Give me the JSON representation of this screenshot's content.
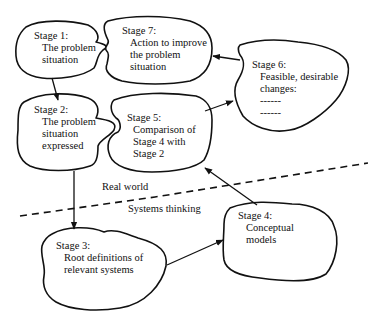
{
  "diagram": {
    "type": "soft-systems-methodology",
    "stages": [
      {
        "id": "stage1",
        "title": "Stage 1:",
        "lines": [
          "The problem",
          "situation"
        ]
      },
      {
        "id": "stage2",
        "title": "Stage 2:",
        "lines": [
          "The problem",
          "situation",
          "expressed"
        ]
      },
      {
        "id": "stage3",
        "title": "Stage 3:",
        "lines": [
          "Root definitions of",
          "relevant systems"
        ]
      },
      {
        "id": "stage4",
        "title": "Stage 4:",
        "lines": [
          "Conceptual",
          "models"
        ]
      },
      {
        "id": "stage5",
        "title": "Stage 5:",
        "lines": [
          "Comparison of",
          "Stage 4 with",
          "Stage 2"
        ]
      },
      {
        "id": "stage6",
        "title": "Stage 6:",
        "lines": [
          "Feasible, desirable",
          "changes:",
          "------",
          "------"
        ]
      },
      {
        "id": "stage7",
        "title": "Stage 7:",
        "lines": [
          "Action to improve",
          "the problem",
          "situation"
        ]
      }
    ],
    "edges": [
      {
        "from": "stage1",
        "to": "stage2"
      },
      {
        "from": "stage2",
        "to": "stage3"
      },
      {
        "from": "stage3",
        "to": "stage4"
      },
      {
        "from": "stage4",
        "to": "stage5"
      },
      {
        "from": "stage5",
        "to": "stage6"
      },
      {
        "from": "stage6",
        "to": "stage7"
      }
    ],
    "divider": {
      "style": "dashed",
      "above_label": "Real world",
      "below_label": "Systems thinking"
    }
  }
}
